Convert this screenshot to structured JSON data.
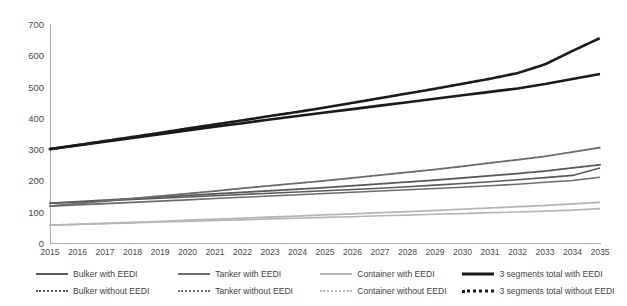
{
  "chart_data": {
    "type": "line",
    "title": "",
    "subtitle": "",
    "xlabel": "",
    "ylabel": "",
    "xlim": [
      2015,
      2035
    ],
    "ylim": [
      0,
      700
    ],
    "ytick_step": 100,
    "grid": false,
    "legend_position": "bottom",
    "categories": [
      "2015",
      "2016",
      "2017",
      "2018",
      "2019",
      "2020",
      "2021",
      "2022",
      "2023",
      "2024",
      "2025",
      "2026",
      "2027",
      "2028",
      "2029",
      "2030",
      "2031",
      "2032",
      "2033",
      "2034",
      "2035"
    ],
    "yticks": [
      "0",
      "100",
      "200",
      "300",
      "400",
      "500",
      "600",
      "700"
    ],
    "series": [
      {
        "name": "Bulker with EEDI",
        "style": "solid",
        "color": "#595959",
        "width": 1.6,
        "values": [
          127,
          131,
          135,
          139,
          143,
          147,
          151,
          155,
          159,
          163,
          167,
          171,
          175,
          180,
          185,
          190,
          196,
          202,
          209,
          216,
          240
        ]
      },
      {
        "name": "Tanker with EEDI",
        "style": "solid",
        "color": "#6b6b6b",
        "width": 1.6,
        "values": [
          118,
          122,
          126,
          130,
          134,
          138,
          142,
          146,
          150,
          154,
          158,
          162,
          166,
          170,
          174,
          178,
          183,
          188,
          194,
          200,
          210
        ]
      },
      {
        "name": "Container with EEDI",
        "style": "solid",
        "color": "#b5b5b5",
        "width": 1.6,
        "values": [
          57,
          59,
          62,
          64,
          67,
          69,
          72,
          74,
          77,
          79,
          82,
          84,
          87,
          89,
          92,
          94,
          97,
          99,
          102,
          105,
          110
        ]
      },
      {
        "name": "3 segments total with EEDI",
        "style": "solid",
        "color": "#1a1a1a",
        "width": 2.6,
        "values": [
          300,
          312,
          324,
          336,
          348,
          360,
          372,
          383,
          395,
          406,
          417,
          428,
          439,
          450,
          461,
          472,
          483,
          494,
          508,
          524,
          540
        ]
      },
      {
        "name": "Bulker without EEDI",
        "style": "dotted",
        "color": "#595959",
        "width": 1.8,
        "values": [
          127,
          132,
          137,
          142,
          147,
          152,
          157,
          162,
          167,
          172,
          177,
          183,
          189,
          195,
          201,
          208,
          215,
          222,
          230,
          240,
          250
        ]
      },
      {
        "name": "Tanker without EEDI",
        "style": "dotted",
        "color": "#6b6b6b",
        "width": 1.8,
        "values": [
          118,
          126,
          134,
          142,
          150,
          158,
          166,
          175,
          183,
          191,
          199,
          208,
          217,
          226,
          235,
          245,
          256,
          266,
          277,
          291,
          305
        ]
      },
      {
        "name": "Container without EEDI",
        "style": "dotted",
        "color": "#b5b5b5",
        "width": 1.8,
        "values": [
          57,
          60,
          63,
          66,
          69,
          73,
          76,
          79,
          83,
          86,
          90,
          93,
          97,
          100,
          104,
          108,
          112,
          116,
          120,
          125,
          130
        ]
      },
      {
        "name": "3 segments total without EEDI",
        "style": "dotted",
        "color": "#1a1a1a",
        "width": 2.6,
        "values": [
          300,
          313,
          326,
          339,
          352,
          366,
          379,
          392,
          406,
          419,
          433,
          448,
          463,
          478,
          493,
          509,
          525,
          543,
          571,
          614,
          655
        ]
      }
    ]
  },
  "legend": {
    "rows": [
      [
        {
          "label": "Bulker with EEDI",
          "style": "solid",
          "color": "#595959",
          "width": 2
        },
        {
          "label": "Tanker with EEDI",
          "style": "solid",
          "color": "#6b6b6b",
          "width": 2
        },
        {
          "label": "Container with EEDI",
          "style": "solid",
          "color": "#b5b5b5",
          "width": 2
        },
        {
          "label": "3 segments total with EEDI",
          "style": "solid",
          "color": "#1a1a1a",
          "width": 3
        }
      ],
      [
        {
          "label": "Bulker without EEDI",
          "style": "dotted",
          "color": "#595959",
          "width": 2
        },
        {
          "label": "Tanker without EEDI",
          "style": "dotted",
          "color": "#6b6b6b",
          "width": 2
        },
        {
          "label": "Container without EEDI",
          "style": "dotted",
          "color": "#b5b5b5",
          "width": 2
        },
        {
          "label": "3 segments total without EEDI",
          "style": "dotted",
          "color": "#1a1a1a",
          "width": 3
        }
      ]
    ]
  },
  "colors": {
    "axis": "#b0b0b0",
    "tick_text": "#4a4a4a",
    "legend_text": "#3f3f3f",
    "background": "#ffffff"
  }
}
